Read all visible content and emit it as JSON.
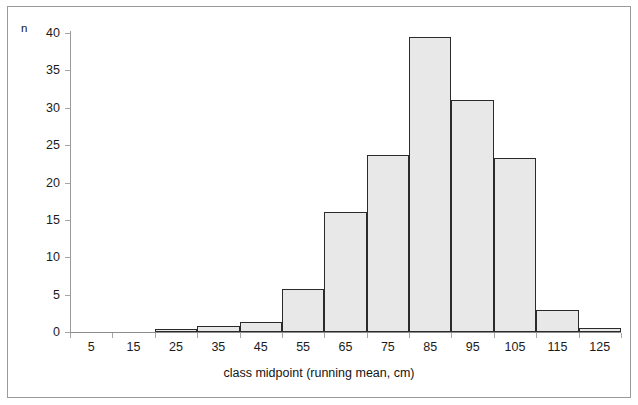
{
  "chart_data": {
    "type": "bar",
    "title": "",
    "xlabel": "class midpoint (running mean, cm)",
    "ylabel": "n",
    "categories": [
      "5",
      "15",
      "25",
      "35",
      "45",
      "55",
      "65",
      "75",
      "85",
      "95",
      "105",
      "115",
      "125"
    ],
    "values": [
      0,
      0,
      0.4,
      0.8,
      1.4,
      5.7,
      16,
      23.7,
      39.4,
      31,
      23.3,
      3,
      0.5
    ],
    "xlim": [
      0,
      130
    ],
    "ylim": [
      0,
      40
    ],
    "ytick_labels": [
      "0",
      "5",
      "10",
      "15",
      "20",
      "25",
      "30",
      "35",
      "40"
    ],
    "ytick_values": [
      0,
      5,
      10,
      15,
      20,
      25,
      30,
      35,
      40
    ],
    "xtick_labels": [
      "5",
      "15",
      "25",
      "35",
      "45",
      "55",
      "65",
      "75",
      "85",
      "95",
      "105",
      "115",
      "125"
    ],
    "grid": false,
    "legend": null,
    "bar_fill_color": "#e8e8e8",
    "bar_edge_color": "#2b2b2b",
    "axis_color": "#9b9b9b",
    "text_color": "#1b1b1b"
  }
}
